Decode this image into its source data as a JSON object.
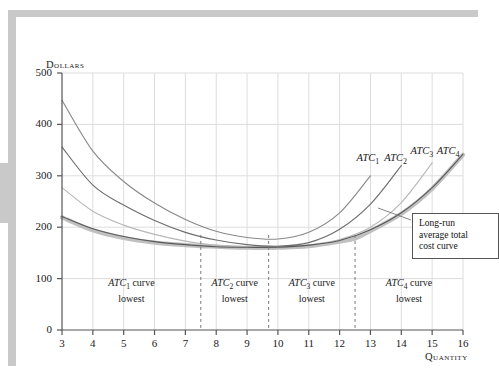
{
  "figure": {
    "y_axis_title": "Dollars",
    "x_axis_title": "Quantity"
  },
  "callout": {
    "line1": "Long-run",
    "line2": "average total",
    "line3": "cost curve"
  },
  "curve_labels": {
    "atc1": "ATC",
    "atc1_sub": "1",
    "atc2": "ATC",
    "atc2_sub": "2",
    "atc3": "ATC",
    "atc3_sub": "3",
    "atc4": "ATC",
    "atc4_sub": "4"
  },
  "regions": [
    {
      "name": "ATC",
      "sub": "1",
      "word": " curve",
      "line2": "lowest"
    },
    {
      "name": "ATC",
      "sub": "2",
      "word": " curve",
      "line2": "lowest"
    },
    {
      "name": "ATC",
      "sub": "3",
      "word": " curve",
      "line2": "lowest"
    },
    {
      "name": "ATC",
      "sub": "4",
      "word": " curve",
      "line2": "lowest"
    }
  ],
  "chart_data": {
    "type": "line",
    "title": "",
    "xlabel": "Quantity",
    "ylabel": "Dollars",
    "xlim": [
      3,
      16
    ],
    "ylim": [
      0,
      500
    ],
    "xticks": [
      3,
      4,
      5,
      6,
      7,
      8,
      9,
      10,
      11,
      12,
      13,
      14,
      15,
      16
    ],
    "yticks": [
      0,
      100,
      200,
      300,
      400,
      500
    ],
    "grid": true,
    "legend_position": "inline-labels",
    "colors": {
      "atc1": "#8a8a8a",
      "atc2": "#6e6e6e",
      "atc3": "#b8b8b8",
      "atc4": "#5a5a5a",
      "lrac": "#c0c0c0",
      "grid": "#dddddd",
      "axis": "#555555"
    },
    "series": [
      {
        "name": "ATC1",
        "color": "#8a8a8a",
        "x": [
          3,
          4,
          5,
          6,
          7,
          8,
          9,
          10,
          11,
          12,
          13
        ],
        "values": [
          447,
          348,
          289,
          247,
          215,
          192,
          180,
          177,
          190,
          228,
          300
        ]
      },
      {
        "name": "ATC2",
        "color": "#6e6e6e",
        "x": [
          3,
          4,
          5,
          6,
          7,
          8,
          9,
          10,
          11,
          12,
          13,
          14
        ],
        "values": [
          356,
          282,
          243,
          213,
          190,
          175,
          166,
          163,
          170,
          196,
          245,
          320
        ]
      },
      {
        "name": "ATC3",
        "color": "#b8b8b8",
        "x": [
          3,
          4,
          5,
          6,
          7,
          8,
          9,
          10,
          11,
          12,
          13,
          14,
          15
        ],
        "values": [
          277,
          231,
          204,
          186,
          173,
          165,
          161,
          160,
          164,
          176,
          200,
          248,
          325
        ]
      },
      {
        "name": "ATC4",
        "color": "#5a5a5a",
        "x": [
          3,
          4,
          5,
          6,
          7,
          8,
          9,
          10,
          11,
          12,
          13,
          14,
          15,
          16
        ],
        "values": [
          221,
          197,
          182,
          172,
          166,
          162,
          161,
          161,
          165,
          174,
          195,
          228,
          277,
          342
        ]
      },
      {
        "name": "Long-run average total cost curve",
        "color": "#c0c0c0",
        "x": [
          3,
          4,
          5,
          6,
          7,
          7.5,
          8,
          9,
          9.7,
          10,
          11,
          12,
          12.5,
          13,
          14,
          15,
          16
        ],
        "values": [
          219,
          194,
          179,
          170,
          165,
          163,
          162,
          160,
          160,
          160,
          163,
          172,
          178,
          193,
          226,
          275,
          341
        ]
      }
    ],
    "dashed_verticals": [
      7.5,
      9.7,
      12.5
    ],
    "annotations": [
      {
        "text": "ATC1",
        "x": 13.0,
        "y": 330
      },
      {
        "text": "ATC2",
        "x": 13.9,
        "y": 330
      },
      {
        "text": "ATC3",
        "x": 14.75,
        "y": 345
      },
      {
        "text": "ATC4",
        "x": 15.6,
        "y": 345
      },
      {
        "text": "Long-run average total cost curve",
        "x": 14.2,
        "y": 205
      }
    ],
    "region_bands": [
      {
        "label": "ATC1 curve lowest",
        "from": 3,
        "to": 7.5
      },
      {
        "label": "ATC2 curve lowest",
        "from": 7.5,
        "to": 9.7
      },
      {
        "label": "ATC3 curve lowest",
        "from": 9.7,
        "to": 12.5
      },
      {
        "label": "ATC4 curve lowest",
        "from": 12.5,
        "to": 16
      }
    ]
  }
}
